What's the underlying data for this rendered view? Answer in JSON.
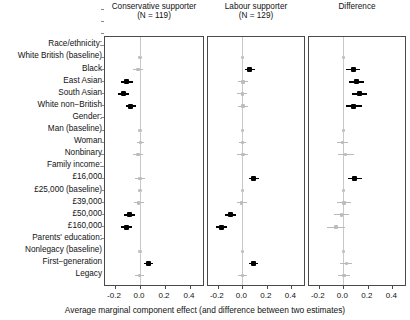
{
  "figure": {
    "xaxis_title": "Average marginal component effect (and difference between two estimates)",
    "tick_labels": [
      "-0.2",
      "0.0",
      "0.2",
      "0.4"
    ],
    "tick_values": [
      -0.2,
      0.0,
      0.2,
      0.4
    ],
    "xlim": [
      -0.28,
      0.52
    ],
    "panels": [
      {
        "title_line1": "Conservative supporter",
        "title_line2": "(N = 119)"
      },
      {
        "title_line1": "Labour supporter",
        "title_line2": "(N = 129)"
      },
      {
        "title_line1": "Difference",
        "title_line2": ""
      }
    ]
  },
  "rows": [
    {
      "label": "Race/ethnicity:",
      "type": "group"
    },
    {
      "label": "White British (baseline)",
      "type": "baseline"
    },
    {
      "label": "Black",
      "type": "item"
    },
    {
      "label": "East Asian",
      "type": "item"
    },
    {
      "label": "South Asian",
      "type": "item"
    },
    {
      "label": "White non−British",
      "type": "item"
    },
    {
      "label": "Gender:",
      "type": "group"
    },
    {
      "label": "Man (baseline)",
      "type": "baseline"
    },
    {
      "label": "Woman",
      "type": "item"
    },
    {
      "label": "Nonbinary",
      "type": "item"
    },
    {
      "label": "Family income:",
      "type": "group"
    },
    {
      "label": "£16,000",
      "type": "item"
    },
    {
      "label": "£25,000 (baseline)",
      "type": "baseline"
    },
    {
      "label": "£39,000",
      "type": "item"
    },
    {
      "label": "£50,000",
      "type": "item"
    },
    {
      "label": "£160,000",
      "type": "item"
    },
    {
      "label": "Parents' education:",
      "type": "group"
    },
    {
      "label": "Nonlegacy (baseline)",
      "type": "baseline"
    },
    {
      "label": "First−generation",
      "type": "item"
    },
    {
      "label": "Legacy",
      "type": "item"
    }
  ],
  "chart_data": {
    "type": "scatter",
    "title": "",
    "xlabel": "Average marginal component effect (and difference between two estimates)",
    "ylabel": "",
    "xlim": [
      -0.28,
      0.52
    ],
    "xticks": [
      -0.2,
      0.0,
      0.2,
      0.4
    ],
    "grid": false,
    "legend": "none",
    "categories": [
      "Race/ethnicity:",
      "White British (baseline)",
      "Black",
      "East Asian",
      "South Asian",
      "White non-British",
      "Gender:",
      "Man (baseline)",
      "Woman",
      "Nonbinary",
      "Family income:",
      "£16,000",
      "£25,000 (baseline)",
      "£39,000",
      "£50,000",
      "£160,000",
      "Parents' education:",
      "Nonlegacy (baseline)",
      "First-generation",
      "Legacy"
    ],
    "series": [
      {
        "name": "Conservative supporter (N = 119)",
        "points": [
          {
            "category": "Race/ethnicity:",
            "estimate": null,
            "lo": null,
            "hi": null,
            "kind": "none"
          },
          {
            "category": "White British (baseline)",
            "estimate": 0.0,
            "lo": 0.0,
            "hi": 0.0,
            "kind": "baseline"
          },
          {
            "category": "Black",
            "estimate": -0.015,
            "lo": -0.055,
            "hi": 0.025,
            "kind": "ns"
          },
          {
            "category": "East Asian",
            "estimate": -0.105,
            "lo": -0.15,
            "hi": -0.06,
            "kind": "sig"
          },
          {
            "category": "South Asian",
            "estimate": -0.135,
            "lo": -0.18,
            "hi": -0.09,
            "kind": "sig"
          },
          {
            "category": "White non-British",
            "estimate": -0.075,
            "lo": -0.115,
            "hi": -0.03,
            "kind": "sig"
          },
          {
            "category": "Gender:",
            "estimate": null,
            "lo": null,
            "hi": null,
            "kind": "none"
          },
          {
            "category": "Man (baseline)",
            "estimate": 0.0,
            "lo": 0.0,
            "hi": 0.0,
            "kind": "baseline"
          },
          {
            "category": "Woman",
            "estimate": 0.005,
            "lo": -0.025,
            "hi": 0.035,
            "kind": "ns"
          },
          {
            "category": "Nonbinary",
            "estimate": -0.015,
            "lo": -0.055,
            "hi": 0.025,
            "kind": "ns"
          },
          {
            "category": "Family income:",
            "estimate": null,
            "lo": null,
            "hi": null,
            "kind": "none"
          },
          {
            "category": "£16,000",
            "estimate": 0.0,
            "lo": -0.04,
            "hi": 0.04,
            "kind": "ns"
          },
          {
            "category": "£25,000 (baseline)",
            "estimate": 0.0,
            "lo": 0.0,
            "hi": 0.0,
            "kind": "baseline"
          },
          {
            "category": "£39,000",
            "estimate": -0.01,
            "lo": -0.05,
            "hi": 0.03,
            "kind": "ns"
          },
          {
            "category": "£50,000",
            "estimate": -0.085,
            "lo": -0.13,
            "hi": -0.04,
            "kind": "sig"
          },
          {
            "category": "£160,000",
            "estimate": -0.11,
            "lo": -0.155,
            "hi": -0.065,
            "kind": "sig"
          },
          {
            "category": "Parents' education:",
            "estimate": null,
            "lo": null,
            "hi": null,
            "kind": "none"
          },
          {
            "category": "Nonlegacy (baseline)",
            "estimate": 0.0,
            "lo": 0.0,
            "hi": 0.0,
            "kind": "baseline"
          },
          {
            "category": "First-generation",
            "estimate": 0.065,
            "lo": 0.03,
            "hi": 0.1,
            "kind": "sig"
          },
          {
            "category": "Legacy",
            "estimate": -0.005,
            "lo": -0.04,
            "hi": 0.03,
            "kind": "ns"
          }
        ]
      },
      {
        "name": "Labour supporter (N = 129)",
        "points": [
          {
            "category": "Race/ethnicity:",
            "estimate": null,
            "lo": null,
            "hi": null,
            "kind": "none"
          },
          {
            "category": "White British (baseline)",
            "estimate": 0.0,
            "lo": 0.0,
            "hi": 0.0,
            "kind": "baseline"
          },
          {
            "category": "Black",
            "estimate": 0.06,
            "lo": 0.02,
            "hi": 0.1,
            "kind": "sig"
          },
          {
            "category": "East Asian",
            "estimate": 0.005,
            "lo": -0.035,
            "hi": 0.045,
            "kind": "ns"
          },
          {
            "category": "South Asian",
            "estimate": 0.0,
            "lo": -0.04,
            "hi": 0.04,
            "kind": "ns"
          },
          {
            "category": "White non-British",
            "estimate": 0.005,
            "lo": -0.035,
            "hi": 0.05,
            "kind": "ns"
          },
          {
            "category": "Gender:",
            "estimate": null,
            "lo": null,
            "hi": null,
            "kind": "none"
          },
          {
            "category": "Man (baseline)",
            "estimate": 0.0,
            "lo": 0.0,
            "hi": 0.0,
            "kind": "baseline"
          },
          {
            "category": "Woman",
            "estimate": 0.0,
            "lo": -0.03,
            "hi": 0.03,
            "kind": "ns"
          },
          {
            "category": "Nonbinary",
            "estimate": 0.005,
            "lo": -0.04,
            "hi": 0.05,
            "kind": "ns"
          },
          {
            "category": "Family income:",
            "estimate": null,
            "lo": null,
            "hi": null,
            "kind": "none"
          },
          {
            "category": "£16,000",
            "estimate": 0.095,
            "lo": 0.055,
            "hi": 0.14,
            "kind": "sig"
          },
          {
            "category": "£25,000 (baseline)",
            "estimate": 0.0,
            "lo": 0.0,
            "hi": 0.0,
            "kind": "baseline"
          },
          {
            "category": "£39,000",
            "estimate": -0.005,
            "lo": -0.045,
            "hi": 0.035,
            "kind": "ns"
          },
          {
            "category": "£50,000",
            "estimate": -0.1,
            "lo": -0.145,
            "hi": -0.055,
            "kind": "sig"
          },
          {
            "category": "£160,000",
            "estimate": -0.17,
            "lo": -0.215,
            "hi": -0.125,
            "kind": "sig"
          },
          {
            "category": "Parents' education:",
            "estimate": null,
            "lo": null,
            "hi": null,
            "kind": "none"
          },
          {
            "category": "Nonlegacy (baseline)",
            "estimate": 0.0,
            "lo": 0.0,
            "hi": 0.0,
            "kind": "baseline"
          },
          {
            "category": "First-generation",
            "estimate": 0.09,
            "lo": 0.055,
            "hi": 0.125,
            "kind": "sig"
          },
          {
            "category": "Legacy",
            "estimate": 0.0,
            "lo": -0.035,
            "hi": 0.035,
            "kind": "ns"
          }
        ]
      },
      {
        "name": "Difference",
        "points": [
          {
            "category": "Race/ethnicity:",
            "estimate": null,
            "lo": null,
            "hi": null,
            "kind": "none"
          },
          {
            "category": "White British (baseline)",
            "estimate": 0.0,
            "lo": 0.0,
            "hi": 0.0,
            "kind": "baseline"
          },
          {
            "category": "Black",
            "estimate": 0.08,
            "lo": 0.02,
            "hi": 0.14,
            "kind": "sig"
          },
          {
            "category": "East Asian",
            "estimate": 0.11,
            "lo": 0.05,
            "hi": 0.17,
            "kind": "sig"
          },
          {
            "category": "South Asian",
            "estimate": 0.135,
            "lo": 0.075,
            "hi": 0.195,
            "kind": "sig"
          },
          {
            "category": "White non-British",
            "estimate": 0.085,
            "lo": 0.02,
            "hi": 0.15,
            "kind": "sig"
          },
          {
            "category": "Gender:",
            "estimate": null,
            "lo": null,
            "hi": null,
            "kind": "none"
          },
          {
            "category": "Man (baseline)",
            "estimate": 0.0,
            "lo": 0.0,
            "hi": 0.0,
            "kind": "baseline"
          },
          {
            "category": "Woman",
            "estimate": -0.005,
            "lo": -0.05,
            "hi": 0.04,
            "kind": "ns"
          },
          {
            "category": "Nonbinary",
            "estimate": 0.02,
            "lo": -0.04,
            "hi": 0.085,
            "kind": "ns"
          },
          {
            "category": "Family income:",
            "estimate": null,
            "lo": null,
            "hi": null,
            "kind": "none"
          },
          {
            "category": "£16,000",
            "estimate": 0.095,
            "lo": 0.035,
            "hi": 0.155,
            "kind": "sig"
          },
          {
            "category": "£25,000 (baseline)",
            "estimate": 0.0,
            "lo": 0.0,
            "hi": 0.0,
            "kind": "baseline"
          },
          {
            "category": "£39,000",
            "estimate": 0.005,
            "lo": -0.055,
            "hi": 0.06,
            "kind": "ns"
          },
          {
            "category": "£50,000",
            "estimate": -0.015,
            "lo": -0.075,
            "hi": 0.05,
            "kind": "ns"
          },
          {
            "category": "£160,000",
            "estimate": -0.06,
            "lo": -0.13,
            "hi": 0.01,
            "kind": "ns"
          },
          {
            "category": "Parents' education:",
            "estimate": null,
            "lo": null,
            "hi": null,
            "kind": "none"
          },
          {
            "category": "Nonlegacy (baseline)",
            "estimate": 0.0,
            "lo": 0.0,
            "hi": 0.0,
            "kind": "baseline"
          },
          {
            "category": "First-generation",
            "estimate": 0.025,
            "lo": -0.025,
            "hi": 0.075,
            "kind": "ns"
          },
          {
            "category": "Legacy",
            "estimate": 0.005,
            "lo": -0.045,
            "hi": 0.055,
            "kind": "ns"
          }
        ]
      }
    ]
  }
}
